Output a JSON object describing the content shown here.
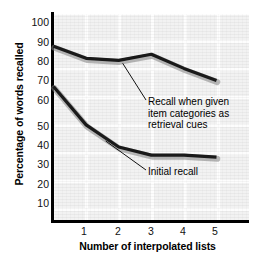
{
  "chart_data": {
    "type": "line",
    "title": "",
    "xlabel": "Number of interpolated lists",
    "ylabel": "Percentage of words recalled",
    "x": [
      0,
      1,
      2,
      3,
      4,
      5
    ],
    "xlim": [
      0,
      5.9
    ],
    "ylim": [
      0,
      105
    ],
    "xticks": [
      "1",
      "2",
      "3",
      "4",
      "5"
    ],
    "yticks": [
      "10",
      "20",
      "30",
      "40",
      "50",
      "60",
      "70",
      "80",
      "90",
      "100"
    ],
    "grid": true,
    "legend_position": "inline-annotations",
    "series": [
      {
        "name": "Recall when given item categories as retrieval cues",
        "values": [
          88,
          82,
          81,
          84,
          77,
          71
        ],
        "color": "#1a1a1a"
      },
      {
        "name": "Initial recall",
        "values": [
          68,
          49,
          38,
          34,
          34,
          33
        ],
        "color": "#1a1a1a"
      }
    ],
    "annotations": [
      {
        "name": "cued-recall-label",
        "text": "Recall when given item categories as retrieval cues",
        "lines": [
          "Recall when given",
          "item categories as",
          "retrieval cues"
        ]
      },
      {
        "name": "initial-recall-label",
        "text": "Initial recall",
        "lines": [
          "Initial recall"
        ]
      }
    ]
  },
  "axes": {
    "y_title": "Percentage of words recalled",
    "x_title": "Number of interpolated lists",
    "y_ticks": [
      {
        "label": "100",
        "top": 17
      },
      {
        "label": "90",
        "top": 37
      },
      {
        "label": "80",
        "top": 56
      },
      {
        "label": "70",
        "top": 75
      },
      {
        "label": "60",
        "top": 95
      },
      {
        "label": "50",
        "top": 121
      },
      {
        "label": "40",
        "top": 140
      },
      {
        "label": "30",
        "top": 159
      },
      {
        "label": "20",
        "top": 179
      },
      {
        "label": "10",
        "top": 198
      }
    ],
    "x_ticks": [
      {
        "label": "1",
        "left": 76
      },
      {
        "label": "2",
        "left": 110
      },
      {
        "label": "3",
        "left": 143
      },
      {
        "label": "4",
        "left": 175
      },
      {
        "label": "5",
        "left": 207
      }
    ]
  }
}
